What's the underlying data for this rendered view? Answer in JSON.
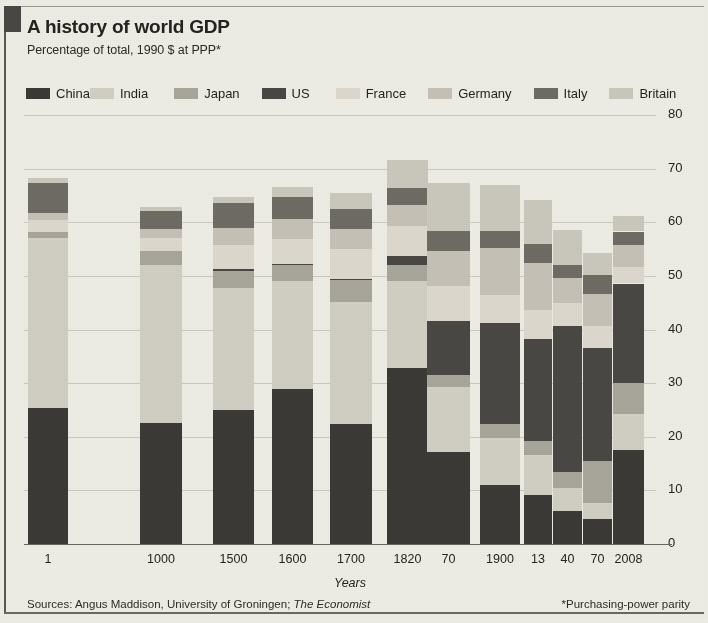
{
  "header": {
    "title": "A history of world GDP",
    "subtitle": "Percentage of total, 1990 $  at PPP*"
  },
  "legend": {
    "position": "top",
    "items": [
      {
        "label": "China",
        "color": "#3b3a37"
      },
      {
        "label": "India",
        "color": "#d2cfc4"
      },
      {
        "label": "Japan",
        "color": "#a9a69a"
      },
      {
        "label": "US",
        "color": "#4a4844"
      },
      {
        "label": "France",
        "color": "#ddd9cf"
      },
      {
        "label": "Germany",
        "color": "#c6c2b6"
      },
      {
        "label": "Italy",
        "color": "#6e6c65"
      },
      {
        "label": "Britain",
        "color": "#cbc8bd"
      }
    ]
  },
  "axes": {
    "ylabel": "",
    "xlabel": "Years",
    "yticks": [
      "0",
      "10",
      "20",
      "30",
      "40",
      "50",
      "60",
      "70",
      "80"
    ],
    "ylim": [
      0,
      80
    ]
  },
  "footer": {
    "sources_prefix": "Sources: Angus Maddison, University of Groningen; ",
    "sources_italic": "The Economist",
    "footnote": "*Purchasing-power parity"
  },
  "chart_data": {
    "type": "bar",
    "stacked": true,
    "title": "A history of world GDP",
    "subtitle": "Percentage of total, 1990 $  at PPP*",
    "xlabel": "Years",
    "ylabel": "Percentage of total",
    "ylim": [
      0,
      80
    ],
    "yticks": [
      0,
      10,
      20,
      30,
      40,
      50,
      60,
      70,
      80
    ],
    "grid": true,
    "categories": [
      "1",
      "1000",
      "1500",
      "1600",
      "1700",
      "1820",
      "70",
      "1900",
      "13",
      "40",
      "70",
      "2008"
    ],
    "series": [
      {
        "name": "China",
        "color": "#3b3a37",
        "values": [
          25.4,
          22.6,
          25.0,
          29.0,
          22.3,
          32.9,
          17.1,
          11.0,
          9.1,
          6.2,
          4.6,
          17.5
        ]
      },
      {
        "name": "India",
        "color": "#d2cfc4",
        "values": [
          31.6,
          29.4,
          22.8,
          20.1,
          22.9,
          16.1,
          12.2,
          8.7,
          7.5,
          4.2,
          3.1,
          6.7
        ]
      },
      {
        "name": "Japan",
        "color": "#a9a69a",
        "values": [
          1.2,
          2.7,
          3.2,
          2.9,
          4.1,
          3.0,
          2.3,
          2.6,
          2.6,
          3.0,
          7.8,
          5.8
        ]
      },
      {
        "name": "US",
        "color": "#4a4844",
        "values": [
          0.0,
          0.0,
          0.3,
          0.2,
          0.1,
          1.8,
          10.0,
          18.9,
          19.1,
          27.3,
          21.1,
          18.6
        ]
      },
      {
        "name": "France",
        "color": "#ddd9cf",
        "values": [
          2.2,
          2.4,
          4.4,
          4.7,
          5.7,
          5.5,
          6.5,
          5.3,
          5.3,
          4.2,
          4.1,
          3.1
        ]
      },
      {
        "name": "Germany",
        "color": "#c6c2b6",
        "values": [
          1.4,
          1.6,
          3.3,
          3.8,
          3.6,
          3.9,
          6.5,
          8.8,
          8.8,
          4.7,
          5.9,
          4.0
        ]
      },
      {
        "name": "Italy",
        "color": "#6e6c65",
        "values": [
          5.6,
          3.4,
          4.7,
          4.1,
          3.8,
          3.2,
          3.8,
          3.1,
          3.5,
          2.4,
          3.5,
          2.6
        ]
      },
      {
        "name": "Britain",
        "color": "#cbc8bd",
        "values": [
          0.8,
          0.7,
          1.1,
          1.8,
          2.9,
          5.2,
          9.0,
          8.6,
          8.2,
          6.5,
          4.2,
          2.9
        ]
      }
    ],
    "annotations": [
      "Sources: Angus Maddison, University of Groningen; The Economist",
      "*Purchasing-power parity"
    ]
  }
}
